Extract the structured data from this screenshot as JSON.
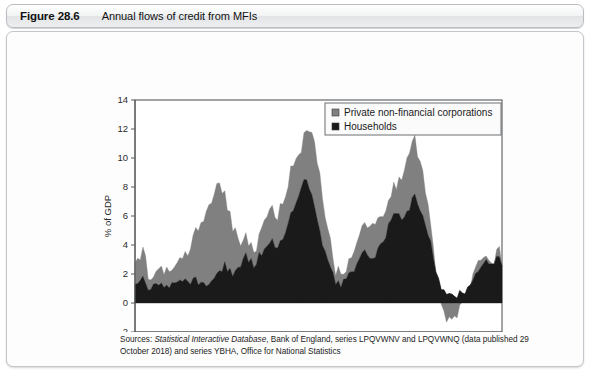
{
  "figure": {
    "number": "Figure 28.6",
    "caption": "Annual flows of credit from MFIs"
  },
  "source": {
    "prefix": "Sources: ",
    "italic_title": "Statistical Interactive Database",
    "rest": ", Bank of England, series LPQVWNV and LPQVWNQ (data published 29 October 2018) and series YBHA, Office for National Statistics"
  },
  "colors": {
    "households": "#1a1a1a",
    "corporations": "#808080",
    "axis": "#58595b",
    "plot_background": "#ffffff",
    "header_border": "#b9bdc2"
  },
  "chart_data": {
    "type": "area",
    "stacked": true,
    "title": "",
    "xlabel": "",
    "ylabel": "% of GDP",
    "xlim": [
      1970,
      2018
    ],
    "ylim": [
      -2,
      14
    ],
    "yticks": [
      -2,
      0,
      2,
      4,
      6,
      8,
      10,
      12,
      14
    ],
    "xticks": [
      1970,
      1975,
      1980,
      1985,
      1990,
      1995,
      2000,
      2005,
      2010,
      2015
    ],
    "grid": false,
    "legend_position": "top-right",
    "x_minor_tick_interval": 1,
    "series": [
      {
        "name": "Households",
        "color": "#1a1a1a",
        "values": [
          1.5,
          1.2,
          1.8,
          1.6,
          1.1,
          0.9,
          1.0,
          1.2,
          1.4,
          1.3,
          1.1,
          1.0,
          1.2,
          1.1,
          1.3,
          1.2,
          1.4,
          1.3,
          1.5,
          1.4,
          1.3,
          1.2,
          1.4,
          1.6,
          1.5,
          1.3,
          1.2,
          1.4,
          1.5,
          1.6,
          1.8,
          2.0,
          2.2,
          2.4,
          2.6,
          2.4,
          2.2,
          2.0,
          2.2,
          2.4,
          2.6,
          2.9,
          3.2,
          3.0,
          2.8,
          2.6,
          2.9,
          3.2,
          3.5,
          3.8,
          4.1,
          4.4,
          4.2,
          4.0,
          3.8,
          4.2,
          4.6,
          5.0,
          5.5,
          6.0,
          6.5,
          7.0,
          7.6,
          8.2,
          8.6,
          8.4,
          8.0,
          7.4,
          6.6,
          5.8,
          5.0,
          4.2,
          3.5,
          2.8,
          2.2,
          1.8,
          1.5,
          1.3,
          1.2,
          1.4,
          1.6,
          1.8,
          2.0,
          2.3,
          2.6,
          2.9,
          3.2,
          3.5,
          3.4,
          3.2,
          3.0,
          3.2,
          3.6,
          4.0,
          4.4,
          4.8,
          5.2,
          5.6,
          6.0,
          6.3,
          6.0,
          5.6,
          5.8,
          6.2,
          6.6,
          7.0,
          7.4,
          7.0,
          6.6,
          6.2,
          5.6,
          4.8,
          4.0,
          3.2,
          2.4,
          1.8,
          1.2,
          0.8,
          0.6,
          0.5,
          0.4,
          0.5,
          0.6,
          0.7,
          0.8,
          0.9,
          1.1,
          1.3,
          1.6,
          1.9,
          2.2,
          2.5,
          2.8,
          2.9,
          2.7,
          2.6,
          2.8,
          3.0,
          2.9,
          2.8
        ],
        "note": "Black lower band; annual flow of credit to households as % of GDP, quarterly observations 1970-2018."
      },
      {
        "name": "Private non-financial corporations",
        "color": "#808080",
        "values": [
          1.8,
          1.6,
          1.4,
          2.2,
          2.0,
          1.1,
          0.9,
          0.8,
          1.0,
          1.2,
          0.9,
          0.7,
          0.9,
          1.1,
          0.8,
          0.9,
          1.1,
          1.3,
          1.5,
          1.8,
          2.1,
          2.4,
          2.8,
          3.2,
          3.6,
          4.0,
          4.4,
          4.8,
          5.2,
          5.6,
          6.0,
          6.2,
          5.8,
          5.4,
          5.0,
          4.4,
          3.8,
          3.2,
          2.6,
          2.2,
          1.8,
          1.5,
          1.3,
          1.2,
          1.1,
          1.0,
          1.2,
          1.4,
          1.6,
          1.8,
          2.0,
          2.2,
          2.4,
          2.2,
          2.0,
          2.2,
          2.4,
          2.6,
          2.8,
          3.0,
          3.2,
          3.0,
          2.8,
          2.6,
          3.0,
          3.4,
          3.8,
          4.2,
          4.4,
          4.2,
          3.8,
          3.2,
          2.6,
          2.0,
          1.6,
          1.2,
          0.9,
          0.7,
          0.6,
          0.5,
          0.6,
          0.8,
          1.0,
          1.2,
          1.4,
          1.6,
          1.8,
          2.0,
          2.2,
          2.4,
          2.6,
          2.4,
          2.2,
          2.0,
          1.8,
          1.6,
          1.4,
          1.6,
          1.8,
          2.0,
          2.4,
          2.8,
          3.2,
          3.6,
          4.0,
          4.2,
          4.0,
          3.6,
          3.2,
          2.8,
          2.4,
          1.8,
          1.2,
          0.6,
          0.0,
          -0.6,
          -1.2,
          -1.6,
          -1.8,
          -1.6,
          -1.4,
          -1.2,
          -1.0,
          -0.8,
          -0.6,
          -0.4,
          -0.2,
          0.0,
          0.2,
          0.3,
          0.4,
          0.3,
          0.2,
          0.3,
          0.4,
          0.3,
          0.2,
          0.3,
          0.4,
          0.3
        ],
        "note": "Grey upper band, stacked on top of households; can be negative (net repayment) around 2009-2012."
      }
    ],
    "annotations": [
      {
        "label": "peak total",
        "approx_year": 1990,
        "approx_value": 13.0
      },
      {
        "label": "peak total",
        "approx_year": 2007,
        "approx_value": 11.6
      },
      {
        "label": "trough total",
        "approx_year": 2011,
        "approx_value": -1.4
      }
    ]
  },
  "legend": {
    "entries": [
      {
        "label": "Private non-financial corporations",
        "color": "#808080"
      },
      {
        "label": "Households",
        "color": "#1a1a1a"
      }
    ]
  }
}
